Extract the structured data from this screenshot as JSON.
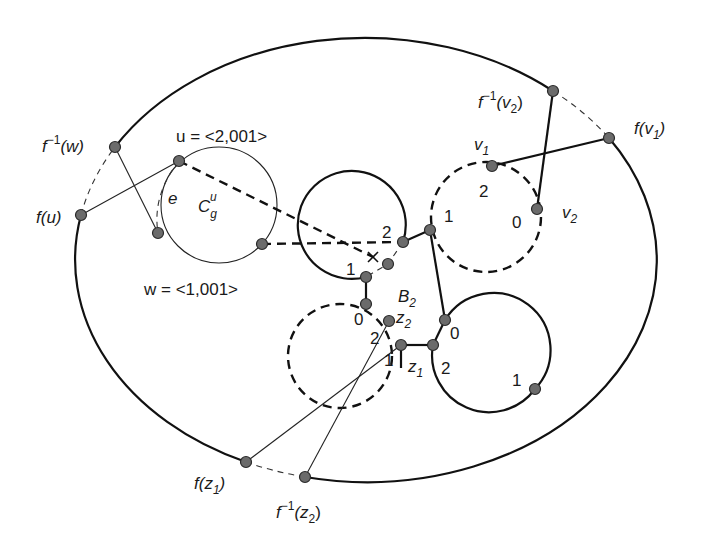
{
  "labels": {
    "f_inv_w": "f",
    "f_inv_w_sup": "−1",
    "f_inv_w_arg": "(w)",
    "f_u": "f(u)",
    "u_def": "u = <2,001>",
    "w_def": "w = <1,001>",
    "e": "e",
    "C": "C",
    "C_sub": "g",
    "C_sup": "u",
    "f_inv_v2": "f",
    "f_inv_v2_sup": "−1",
    "f_inv_v2_arg_open": "(v",
    "f_inv_v2_sub": "2",
    "f_inv_v2_arg_close": ")",
    "f_v1_open": "f(v",
    "f_v1_sub": "1",
    "f_v1_close": ")",
    "v1": "v",
    "v1_sub": "1",
    "v2": "v",
    "v2_sub": "2",
    "B2": "B",
    "B2_sub": "2",
    "z1": "z",
    "z1_sub": "1",
    "z2": "z",
    "z2_sub": "2",
    "f_z1_open": "f(z",
    "f_z1_sub": "1",
    "f_z1_close": ")",
    "f_inv_z2": "f",
    "f_inv_z2_sup": "−1",
    "f_inv_z2_open": "(z",
    "f_inv_z2_sub": "2",
    "f_inv_z2_close": ")"
  },
  "port_numbers": {
    "top_circle": [
      "2",
      "1"
    ],
    "right_dashed_circle": [
      "2",
      "1",
      "0"
    ],
    "bottom_left_dashed_circle": [
      "0",
      "2",
      "1"
    ],
    "bottom_right_circle": [
      "0",
      "2",
      "1"
    ]
  },
  "colors": {
    "line": "#111111",
    "node_fill": "#6b6b6b",
    "background": "#ffffff"
  }
}
